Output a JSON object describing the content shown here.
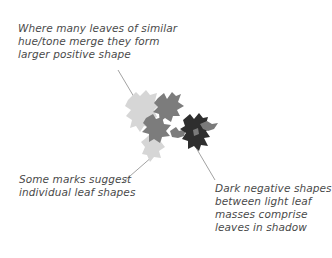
{
  "annotations": {
    "positive_shape": {
      "lines": [
        "Where many leaves of similar",
        "hue/tone merge they form",
        "larger positive shape"
      ]
    },
    "individual_leaf": {
      "lines": [
        "Some marks suggest",
        "individual leaf shapes"
      ]
    },
    "negative_shapes": {
      "lines": [
        "Dark negative shapes",
        "between light leaf",
        "masses comprise",
        "leaves in shadow"
      ]
    }
  },
  "colors": {
    "background": "#ffffff",
    "text": "#4a4a4a",
    "leader_line": "#8a8a8a",
    "light_leaf": "#d4d4d4",
    "mid_leaf": "#7c7c7c",
    "dark_leaf": "#2e2e2e"
  }
}
